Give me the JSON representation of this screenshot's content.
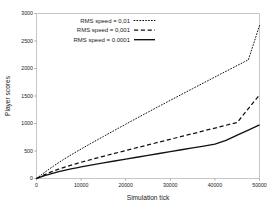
{
  "chart_data": {
    "type": "line",
    "title": "",
    "xlabel": "Simulation tick",
    "ylabel": "Player scores",
    "xlim": [
      0,
      50000
    ],
    "ylim": [
      0,
      3000
    ],
    "xticks": [
      0,
      10000,
      20000,
      30000,
      40000,
      50000
    ],
    "yticks": [
      0,
      500,
      1000,
      1500,
      2000,
      2500,
      3000
    ],
    "xticklabels": [
      "0",
      "10000",
      "20000",
      "30000",
      "40000",
      "50000"
    ],
    "yticklabels": [
      "0",
      "500",
      "1000",
      "1500",
      "2000",
      "2500",
      "3000"
    ],
    "grid": false,
    "legend_position": "upper left",
    "line_color": "#111111",
    "x": [
      0,
      1000,
      2000,
      3000,
      4000,
      5000,
      6000,
      7000,
      8000,
      9000,
      10000,
      12500,
      15000,
      17500,
      20000,
      22500,
      25000,
      27500,
      30000,
      32500,
      35000,
      37500,
      40000,
      42500,
      45000,
      47500,
      50000
    ],
    "series": [
      {
        "name": "RMS speed = 0,01",
        "linestyle": "dotted",
        "values": [
          0,
          62,
          122,
          180,
          236,
          290,
          342,
          392,
          441,
          489,
          536,
          651,
          764,
          876,
          987,
          1097,
          1206,
          1314,
          1421,
          1528,
          1634,
          1740,
          1845,
          1950,
          2054,
          2158,
          2780
        ]
      },
      {
        "name": "RMS speed = 0,001",
        "linestyle": "dashed",
        "values": [
          0,
          40,
          76,
          110,
          141,
          170,
          197,
          223,
          248,
          272,
          295,
          350,
          404,
          456,
          508,
          560,
          611,
          662,
          713,
          764,
          815,
          866,
          917,
          968,
          1019,
          1270,
          1520
        ]
      },
      {
        "name": "RMS speed = 0.0001",
        "linestyle": "solid",
        "values": [
          0,
          30,
          57,
          81,
          103,
          124,
          143,
          161,
          178,
          194,
          210,
          247,
          283,
          318,
          352,
          386,
          420,
          454,
          488,
          522,
          556,
          590,
          624,
          692,
          790,
          880,
          975
        ]
      }
    ]
  },
  "legend": {
    "entries": [
      {
        "label": "RMS speed = 0,01",
        "style": "dotted"
      },
      {
        "label": "RMS speed = 0,001",
        "style": "dashed"
      },
      {
        "label": "RMS speed = 0.0001",
        "style": "solid"
      }
    ]
  },
  "axes": {
    "xlabel": "Simulation tick",
    "ylabel": "Player scores"
  }
}
